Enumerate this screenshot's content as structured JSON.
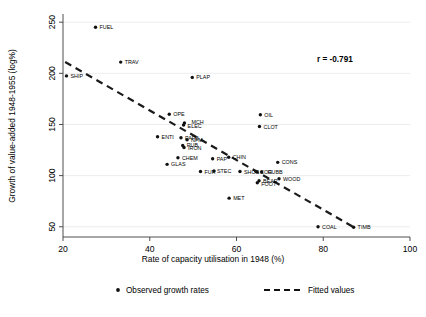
{
  "chart_data": {
    "type": "scatter",
    "title": "",
    "xlabel": "Rate of capacity utilisation in 1948 (%)",
    "ylabel": "Growth of value-added 1948-1955 (log%)",
    "xlim": [
      20,
      100
    ],
    "ylim": [
      40,
      258
    ],
    "xticks": [
      20,
      40,
      60,
      80,
      100
    ],
    "yticks": [
      50,
      100,
      150,
      200,
      250
    ],
    "xtick_labels": [
      "20",
      "40",
      "60",
      "80",
      "100"
    ],
    "ytick_labels": [
      "50",
      "100",
      "150",
      "200",
      "250"
    ],
    "grid": true,
    "grid_axis": "y",
    "annotation": "r = -0.791",
    "correlation": -0.791,
    "legend": {
      "position": "bottom",
      "entries": [
        {
          "label": "Observed growth rates",
          "marker": "dot"
        },
        {
          "label": "Fitted values",
          "marker": "dashed-line"
        }
      ]
    },
    "fit_line": {
      "x": [
        20.5,
        87.5
      ],
      "y": [
        211.0,
        48.5
      ]
    },
    "point_label_key": "industry",
    "points": [
      {
        "industry": "FUEL",
        "x": 27.5,
        "y": 245.0,
        "dx": 4,
        "dy": 2
      },
      {
        "industry": "TRAV",
        "x": 33.3,
        "y": 211.0,
        "dx": 4,
        "dy": 2
      },
      {
        "industry": "SHIP",
        "x": 20.8,
        "y": 197.5,
        "dx": 4,
        "dy": 2
      },
      {
        "industry": "PLAP",
        "x": 49.8,
        "y": 196.0,
        "dx": 4,
        "dy": 2
      },
      {
        "industry": "OPE",
        "x": 44.5,
        "y": 160.0,
        "dx": 4,
        "dy": 2
      },
      {
        "industry": "OIL",
        "x": 65.5,
        "y": 159.5,
        "dx": 4,
        "dy": 2
      },
      {
        "industry": "MCH",
        "x": 48.0,
        "y": 151.5,
        "dx": 7,
        "dy": 1
      },
      {
        "industry": "ELEC",
        "x": 47.8,
        "y": 149.5,
        "dx": 4,
        "dy": 3
      },
      {
        "industry": "CLOT",
        "x": 65.3,
        "y": 148.0,
        "dx": 4,
        "dy": 2
      },
      {
        "industry": "ENTI",
        "x": 41.8,
        "y": 138.0,
        "dx": 4,
        "dy": 2
      },
      {
        "industry": "PAPB",
        "x": 47.2,
        "y": 137.0,
        "dx": 4,
        "dy": 2
      },
      {
        "industry": "NFM",
        "x": 48.6,
        "y": 135.0,
        "dx": 4,
        "dy": 2
      },
      {
        "industry": "RUB",
        "x": 47.6,
        "y": 129.5,
        "dx": 4,
        "dy": 2
      },
      {
        "industry": "IRON",
        "x": 47.9,
        "y": 127.5,
        "dx": 4,
        "dy": 3
      },
      {
        "industry": "CHEM",
        "x": 46.5,
        "y": 117.5,
        "dx": 4,
        "dy": 2
      },
      {
        "industry": "PAP",
        "x": 54.5,
        "y": 116.5,
        "dx": 4,
        "dy": 2
      },
      {
        "industry": "CHIN",
        "x": 58.2,
        "y": 118.0,
        "dx": 4,
        "dy": 2
      },
      {
        "industry": "CONS",
        "x": 69.5,
        "y": 113.0,
        "dx": 4,
        "dy": 2
      },
      {
        "industry": "GLAS",
        "x": 44.0,
        "y": 111.0,
        "dx": 4,
        "dy": 2
      },
      {
        "industry": "FUR",
        "x": 51.7,
        "y": 104.0,
        "dx": 4,
        "dy": 2
      },
      {
        "industry": "STEC",
        "x": 54.8,
        "y": 104.5,
        "dx": 3,
        "dy": 2
      },
      {
        "industry": "SHOE",
        "x": 60.8,
        "y": 104.0,
        "dx": 4,
        "dy": 2
      },
      {
        "industry": "COG",
        "x": 64.5,
        "y": 104.0,
        "dx": 4,
        "dy": 2
      },
      {
        "industry": "RUBB",
        "x": 65.8,
        "y": 103.5,
        "dx": 6,
        "dy": 2
      },
      {
        "industry": "WOOD",
        "x": 69.8,
        "y": 97.0,
        "dx": 4,
        "dy": 2
      },
      {
        "industry": "BEAR",
        "x": 65.2,
        "y": 95.0,
        "dx": 4,
        "dy": 2
      },
      {
        "industry": "FOOT",
        "x": 64.8,
        "y": 93.0,
        "dx": 4,
        "dy": 3
      },
      {
        "industry": "MET",
        "x": 58.3,
        "y": 78.0,
        "dx": 4,
        "dy": 2
      },
      {
        "industry": "COAL",
        "x": 78.8,
        "y": 50.0,
        "dx": 4,
        "dy": 2
      },
      {
        "industry": "TIMB",
        "x": 87.0,
        "y": 49.5,
        "dx": 4,
        "dy": 2
      }
    ]
  }
}
